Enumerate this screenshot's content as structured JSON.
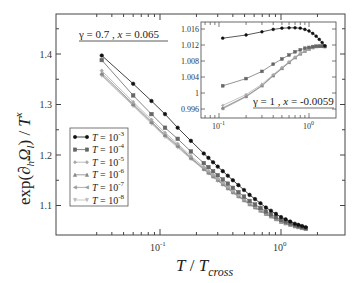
{
  "chart_data": [
    {
      "id": "main",
      "type": "line",
      "title": "",
      "xlabel": "T / T_cross",
      "ylabel": "exp(∂_h Ω_l) / T^x",
      "xscale": "log",
      "xlim": [
        0.022,
        3.0
      ],
      "ylim": [
        1.05,
        1.46
      ],
      "x_ticks": [
        {
          "value": 0.1,
          "label": "10^-1"
        },
        {
          "value": 1,
          "label": "10^0"
        }
      ],
      "y_ticks": [
        1.1,
        1.2,
        1.3,
        1.4
      ],
      "grid": false,
      "legend_position": "lower left",
      "annotation": "γ = 0.7 ,  x = 0.065",
      "x": [
        0.033,
        0.06,
        0.085,
        0.11,
        0.14,
        0.18,
        0.23,
        0.3,
        0.4,
        0.55,
        0.75,
        1.0,
        1.3,
        1.6
      ],
      "series": [
        {
          "name": "T = 10^-3",
          "color": "#111111",
          "marker": "circle",
          "values": [
            1.397,
            1.341,
            1.307,
            1.281,
            1.254,
            1.228,
            1.203,
            1.177,
            1.15,
            1.121,
            1.096,
            1.077,
            1.064,
            1.057
          ]
        },
        {
          "name": "T = 10^-4",
          "color": "#666666",
          "marker": "square",
          "values": [
            1.388,
            1.318,
            1.281,
            1.254,
            1.232,
            1.207,
            1.184,
            1.16,
            1.135,
            1.109,
            1.088,
            1.071,
            1.061,
            1.055
          ]
        },
        {
          "name": "T = 10^-5",
          "color": "#aaaaaa",
          "marker": "diamond",
          "values": [
            1.367,
            1.305,
            1.27,
            1.244,
            1.222,
            1.198,
            1.176,
            1.153,
            1.129,
            1.105,
            1.085,
            1.069,
            1.06,
            1.054
          ]
        },
        {
          "name": "T = 10^-6",
          "color": "#888888",
          "marker": "triangle-up",
          "values": [
            1.362,
            1.301,
            1.266,
            1.24,
            1.219,
            1.195,
            1.173,
            1.151,
            1.127,
            1.103,
            1.084,
            1.068,
            1.059,
            1.054
          ]
        },
        {
          "name": "T = 10^-7",
          "color": "#999999",
          "marker": "triangle-left",
          "values": [
            1.359,
            1.299,
            1.264,
            1.238,
            1.217,
            1.193,
            1.172,
            1.15,
            1.126,
            1.102,
            1.083,
            1.068,
            1.059,
            1.054
          ]
        },
        {
          "name": "T = 10^-8",
          "color": "#bbbbbb",
          "marker": "triangle-down",
          "values": [
            1.357,
            1.297,
            1.262,
            1.236,
            1.215,
            1.192,
            1.171,
            1.149,
            1.125,
            1.102,
            1.083,
            1.067,
            1.059,
            1.054
          ]
        }
      ]
    },
    {
      "id": "inset",
      "type": "line",
      "title": "",
      "xlabel": "",
      "ylabel": "",
      "xscale": "log",
      "xlim": [
        0.063,
        1.8
      ],
      "ylim": [
        0.995,
        1.0175
      ],
      "x_ticks": [
        {
          "value": 0.1,
          "label": "10^-1"
        },
        {
          "value": 1,
          "label": "10^0"
        }
      ],
      "y_ticks": [
        0.996,
        1,
        1.004,
        1.008,
        1.012,
        1.016
      ],
      "grid": false,
      "annotation": "γ = 1 ,  x = -0.0059",
      "x": [
        0.11,
        0.2,
        0.3,
        0.4,
        0.5,
        0.6,
        0.7,
        0.8,
        0.9,
        1.0,
        1.1,
        1.2,
        1.3,
        1.4,
        1.5
      ],
      "series": [
        {
          "name": "T = 10^-3",
          "color": "#111111",
          "marker": "circle",
          "values": [
            1.0137,
            1.0145,
            1.0153,
            1.0159,
            1.0162,
            1.0163,
            1.0163,
            1.0162,
            1.0159,
            1.0155,
            1.0149,
            1.0142,
            1.0134,
            1.0126,
            1.0118
          ]
        },
        {
          "name": "T = 10^-4",
          "color": "#666666",
          "marker": "square",
          "values": [
            1.0018,
            1.0036,
            1.0054,
            1.0072,
            1.0085,
            1.0095,
            1.0103,
            1.0108,
            1.0112,
            1.0114,
            1.0116,
            1.0117,
            1.0117,
            1.0117,
            1.0116
          ]
        },
        {
          "name": "T = 10^-5",
          "color": "#aaaaaa",
          "marker": "diamond",
          "values": [
            0.9969,
            0.9996,
            1.0022,
            1.0046,
            1.0064,
            1.0078,
            1.009,
            1.0099,
            1.0106,
            1.0111,
            1.0114,
            1.0116,
            1.0117,
            1.0117,
            1.0117
          ]
        },
        {
          "name": "T = 10^-6",
          "color": "#888888",
          "marker": "triangle-up",
          "values": [
            0.9963,
            0.9992,
            1.0019,
            1.0044,
            1.0062,
            1.0077,
            1.0089,
            1.0098,
            1.0105,
            1.011,
            1.0114,
            1.0116,
            1.0117,
            1.0117,
            1.0117
          ]
        },
        {
          "name": "T = 10^-7",
          "color": "#999999",
          "marker": "triangle-left",
          "values": [
            0.9961,
            0.9991,
            1.0018,
            1.0043,
            1.0061,
            1.0076,
            1.0088,
            1.0098,
            1.0105,
            1.011,
            1.0113,
            1.0116,
            1.0117,
            1.0117,
            1.0117
          ]
        },
        {
          "name": "T = 10^-8",
          "color": "#bbbbbb",
          "marker": "triangle-down",
          "values": [
            0.996,
            0.999,
            1.0017,
            1.0042,
            1.0061,
            1.0076,
            1.0088,
            1.0097,
            1.0104,
            1.011,
            1.0113,
            1.0116,
            1.0117,
            1.0117,
            1.0117
          ]
        }
      ]
    }
  ],
  "labels": {
    "main_annotation_gamma": "γ = 0.7 ,  ",
    "main_annotation_x": "x",
    "main_annotation_xval": " = 0.065",
    "inset_annotation_gamma": "γ = 1 ,  ",
    "inset_annotation_x": "x",
    "inset_annotation_xval": " = -0.0059",
    "xlabel_T": "T",
    "xlabel_slash": " / ",
    "xlabel_Tc": "T",
    "xlabel_sub": "cross",
    "ylabel_prefix": "exp(∂",
    "ylabel_h": "h",
    "ylabel_Omega": "Ω",
    "ylabel_l": "l",
    "ylabel_suffix": ") / ",
    "ylabel_T": "T",
    "ylabel_x": "x",
    "legend_prefix": "T",
    "legend_eq": " = 10",
    "legend_exponents": [
      "-3",
      "-4",
      "-5",
      "-6",
      "-7",
      "-8"
    ],
    "main_yticks": [
      "1.4",
      "1.3",
      "1.2",
      "1.1"
    ],
    "main_xtick_base": "10",
    "main_xtick_exps": [
      "-1",
      "0"
    ],
    "inset_yticks": [
      "1.016",
      "1.012",
      "1.008",
      "1.004",
      "1",
      "0.996"
    ]
  }
}
